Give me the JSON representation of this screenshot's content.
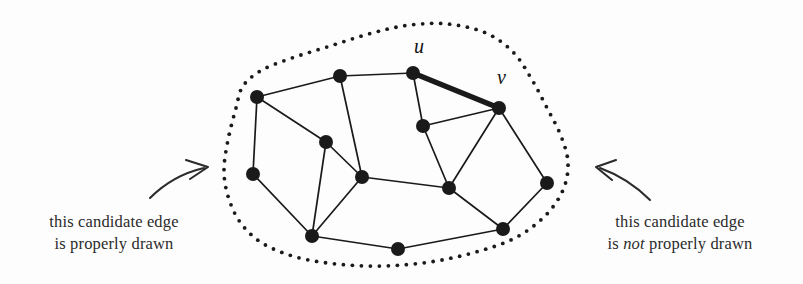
{
  "figure": {
    "width": 803,
    "height": 284,
    "background_color": "#fdfdfd",
    "ink_color": "#1a1a1a"
  },
  "captions": {
    "left": {
      "line1": "this candidate edge",
      "line2_pre": "is",
      "line2_em": "",
      "line2_post": "properly drawn",
      "full": "this candidate edge is properly drawn"
    },
    "right": {
      "line1": "this candidate edge",
      "line2_pre": "is",
      "line2_em": "not",
      "line2_post": "properly drawn",
      "full": "this candidate edge is not properly drawn"
    }
  },
  "vertex_labels": {
    "u": "u",
    "v": "v"
  },
  "annotations": [
    {
      "name": "arrow-left",
      "direction": "up-right",
      "tip_x": 212,
      "tip_y": 166
    },
    {
      "name": "arrow-right",
      "direction": "up-left",
      "tip_x": 597,
      "tip_y": 165
    }
  ],
  "graph": {
    "node_radius": 7,
    "edge_width": 1.7,
    "highlight_edge_width": 5.2,
    "nodes": [
      {
        "id": "n1",
        "x": 257,
        "y": 97,
        "label": ""
      },
      {
        "id": "n2",
        "x": 340,
        "y": 76,
        "label": ""
      },
      {
        "id": "n3",
        "x": 413,
        "y": 73,
        "label": "u"
      },
      {
        "id": "n4",
        "x": 499,
        "y": 108,
        "label": "v"
      },
      {
        "id": "n5",
        "x": 423,
        "y": 126,
        "label": ""
      },
      {
        "id": "n6",
        "x": 253,
        "y": 174,
        "label": ""
      },
      {
        "id": "n7",
        "x": 326,
        "y": 142,
        "label": ""
      },
      {
        "id": "n8",
        "x": 362,
        "y": 177,
        "label": ""
      },
      {
        "id": "n9",
        "x": 449,
        "y": 188,
        "label": ""
      },
      {
        "id": "n10",
        "x": 547,
        "y": 183,
        "label": ""
      },
      {
        "id": "n11",
        "x": 312,
        "y": 236,
        "label": ""
      },
      {
        "id": "n12",
        "x": 398,
        "y": 249,
        "label": ""
      },
      {
        "id": "n13",
        "x": 503,
        "y": 229,
        "label": ""
      }
    ],
    "edges": [
      {
        "from": "n1",
        "to": "n2",
        "highlight": false
      },
      {
        "from": "n2",
        "to": "n3",
        "highlight": false
      },
      {
        "from": "n3",
        "to": "n4",
        "highlight": true
      },
      {
        "from": "n1",
        "to": "n6",
        "highlight": false
      },
      {
        "from": "n1",
        "to": "n7",
        "highlight": false
      },
      {
        "from": "n2",
        "to": "n8",
        "highlight": false
      },
      {
        "from": "n3",
        "to": "n5",
        "highlight": false
      },
      {
        "from": "n4",
        "to": "n5",
        "highlight": false
      },
      {
        "from": "n4",
        "to": "n9",
        "highlight": false
      },
      {
        "from": "n4",
        "to": "n10",
        "highlight": false
      },
      {
        "from": "n5",
        "to": "n9",
        "highlight": false
      },
      {
        "from": "n6",
        "to": "n11",
        "highlight": false
      },
      {
        "from": "n7",
        "to": "n8",
        "highlight": false
      },
      {
        "from": "n7",
        "to": "n11",
        "highlight": false
      },
      {
        "from": "n8",
        "to": "n9",
        "highlight": false
      },
      {
        "from": "n8",
        "to": "n11",
        "highlight": false
      },
      {
        "from": "n9",
        "to": "n13",
        "highlight": false
      },
      {
        "from": "n10",
        "to": "n13",
        "highlight": false
      },
      {
        "from": "n11",
        "to": "n12",
        "highlight": false
      },
      {
        "from": "n12",
        "to": "n13",
        "highlight": false
      }
    ],
    "boundary": {
      "style": "dotted",
      "dot_radius": 1.9,
      "description": "closed dotted blob enclosing the whole graph"
    }
  }
}
